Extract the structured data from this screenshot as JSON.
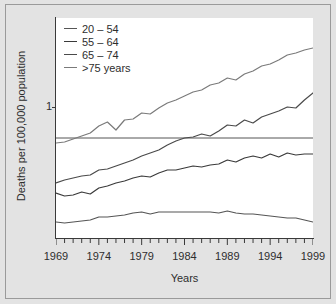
{
  "chart_data": {
    "type": "line",
    "title": "",
    "xlabel": "Years",
    "ylabel": "Deaths per 100,000 population",
    "xlim": [
      1969,
      1999
    ],
    "ylim": [
      0,
      2.2
    ],
    "grid": false,
    "legend_position": "top-left",
    "x_tick_labels": [
      "1969",
      "1974",
      "1979",
      "1984",
      "1989",
      "1994",
      "1999"
    ],
    "x_tick_values": [
      1969,
      1974,
      1979,
      1984,
      1989,
      1994,
      1999
    ],
    "x_minor_tick_interval": 1,
    "y_tick_labels": [
      "1"
    ],
    "y_tick_values": [
      1
    ],
    "reference_line": {
      "y": 1,
      "label": "1"
    },
    "x": [
      1969,
      1970,
      1971,
      1972,
      1973,
      1974,
      1975,
      1976,
      1977,
      1978,
      1979,
      1980,
      1981,
      1982,
      1983,
      1984,
      1985,
      1986,
      1987,
      1988,
      1989,
      1990,
      1991,
      1992,
      1993,
      1994,
      1995,
      1996,
      1997,
      1998,
      1999
    ],
    "series": [
      {
        "name": "20 – 54",
        "color": "#555555",
        "values": [
          0.16,
          0.15,
          0.16,
          0.17,
          0.18,
          0.21,
          0.21,
          0.22,
          0.23,
          0.25,
          0.26,
          0.24,
          0.26,
          0.26,
          0.26,
          0.26,
          0.26,
          0.26,
          0.26,
          0.25,
          0.27,
          0.25,
          0.24,
          0.24,
          0.23,
          0.22,
          0.21,
          0.2,
          0.2,
          0.18,
          0.16
        ]
      },
      {
        "name": "55 – 64",
        "color": "#3a3a3a",
        "values": [
          0.45,
          0.42,
          0.43,
          0.46,
          0.44,
          0.5,
          0.52,
          0.55,
          0.57,
          0.6,
          0.62,
          0.61,
          0.65,
          0.68,
          0.68,
          0.7,
          0.72,
          0.71,
          0.73,
          0.74,
          0.78,
          0.76,
          0.8,
          0.82,
          0.8,
          0.84,
          0.81,
          0.85,
          0.83,
          0.84,
          0.84
        ]
      },
      {
        "name": "65 – 74",
        "color": "#4a4a4a",
        "values": [
          0.55,
          0.58,
          0.6,
          0.62,
          0.63,
          0.68,
          0.69,
          0.72,
          0.75,
          0.78,
          0.82,
          0.85,
          0.88,
          0.93,
          0.97,
          1.0,
          1.01,
          1.04,
          1.02,
          1.07,
          1.13,
          1.12,
          1.18,
          1.15,
          1.21,
          1.24,
          1.27,
          1.31,
          1.3,
          1.38,
          1.45
        ]
      },
      {
        "name": ">75 years",
        "color": "#7a7a7a",
        "values": [
          0.95,
          0.96,
          0.99,
          1.02,
          1.05,
          1.12,
          1.16,
          1.08,
          1.18,
          1.19,
          1.25,
          1.24,
          1.3,
          1.35,
          1.38,
          1.42,
          1.46,
          1.48,
          1.53,
          1.55,
          1.6,
          1.58,
          1.64,
          1.67,
          1.72,
          1.74,
          1.78,
          1.83,
          1.85,
          1.88,
          1.9
        ]
      }
    ]
  },
  "legend": {
    "items": [
      {
        "label": "20 – 54"
      },
      {
        "label": "55 – 64"
      },
      {
        "label": "65 – 74"
      },
      {
        "label": ">75 years"
      }
    ]
  }
}
